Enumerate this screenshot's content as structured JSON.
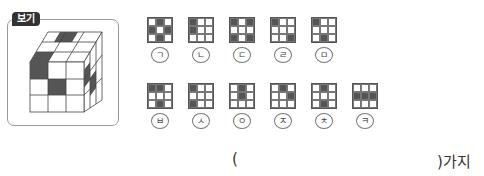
{
  "bogi_label": "보기",
  "options": [
    {
      "label": "ㄱ",
      "cells": [
        0,
        1,
        0,
        1,
        0,
        1,
        0,
        1,
        0
      ]
    },
    {
      "label": "ㄴ",
      "cells": [
        1,
        0,
        0,
        1,
        0,
        0,
        0,
        0,
        0
      ]
    },
    {
      "label": "ㄷ",
      "cells": [
        1,
        0,
        1,
        0,
        0,
        0,
        1,
        0,
        1
      ]
    },
    {
      "label": "ㄹ",
      "cells": [
        1,
        0,
        0,
        0,
        0,
        0,
        0,
        0,
        1
      ]
    },
    {
      "label": "ㅁ",
      "cells": [
        1,
        0,
        0,
        0,
        0,
        0,
        0,
        1,
        0
      ]
    },
    {
      "label": "ㅂ",
      "cells": [
        1,
        1,
        0,
        0,
        0,
        0,
        0,
        1,
        0
      ]
    },
    {
      "label": "ㅅ",
      "cells": [
        1,
        0,
        0,
        0,
        0,
        0,
        1,
        0,
        0
      ]
    },
    {
      "label": "ㅇ",
      "cells": [
        0,
        1,
        0,
        0,
        1,
        0,
        0,
        0,
        0
      ]
    },
    {
      "label": "ㅈ",
      "cells": [
        0,
        1,
        0,
        0,
        0,
        1,
        0,
        0,
        0
      ]
    },
    {
      "label": "ㅊ",
      "cells": [
        0,
        1,
        0,
        0,
        0,
        0,
        0,
        1,
        0
      ]
    },
    {
      "label": "ㅋ",
      "cells": [
        0,
        0,
        0,
        1,
        1,
        1,
        0,
        0,
        0
      ]
    }
  ],
  "answer": {
    "open": "(",
    "close": ")가지",
    "value": ""
  }
}
